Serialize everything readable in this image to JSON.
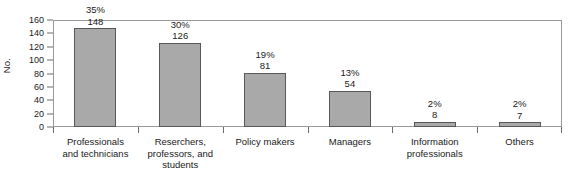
{
  "chart_data": {
    "type": "bar",
    "title": "",
    "xlabel": "",
    "ylabel": "No.",
    "ylim": [
      0,
      160
    ],
    "ytick_step": 20,
    "yticks": [
      160,
      140,
      120,
      100,
      80,
      60,
      40,
      20,
      0
    ],
    "grid": false,
    "legend": null,
    "categories": [
      "Professionals and technicians",
      "Reserchers, professors, and students",
      "Policy makers",
      "Managers",
      "Information professionals",
      "Others"
    ],
    "category_lines": [
      [
        "Professionals",
        "and technicians"
      ],
      [
        "Reserchers,",
        "professors, and",
        "students"
      ],
      [
        "Policy makers"
      ],
      [
        "Managers"
      ],
      [
        "Information",
        "professionals"
      ],
      [
        "Others"
      ]
    ],
    "values": [
      148,
      126,
      81,
      54,
      8,
      7
    ],
    "percent_labels": [
      "35%",
      "30%",
      "19%",
      "13%",
      "2%",
      "2%"
    ],
    "value_labels": [
      "148",
      "126",
      "81",
      "54",
      "8",
      "7"
    ],
    "bar_color": "#a9a9a9",
    "bar_border_color": "#585858",
    "axis_color": "#6b6b6b",
    "frame_color": "#9a9a9a",
    "text_color": "#1a1a1a",
    "background_color": "#ffffff"
  }
}
